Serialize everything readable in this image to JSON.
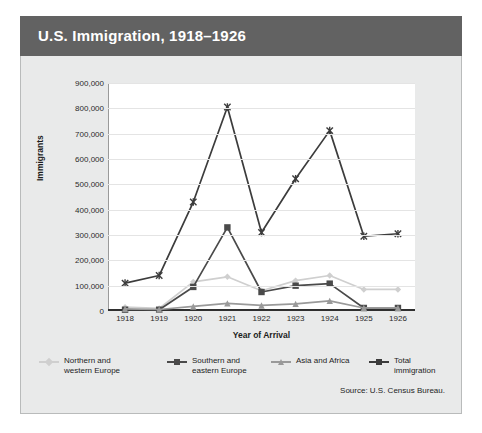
{
  "header": {
    "title": "U.S. Immigration, 1918–1926"
  },
  "source_note": "Source: U.S. Census Bureau.",
  "axis": {
    "ylabel": "Immigrants",
    "xlabel": "Year of Arrival"
  },
  "colors": {
    "title_bar": "#626262",
    "panel": "#e9eaea",
    "plot_bg": "#ffffff",
    "grid": "#e4e4e4",
    "northern_western": "#cfcfcf",
    "southern_eastern": "#4a4a4a",
    "asia_africa": "#9a9a9a",
    "total": "#3c3c3c"
  },
  "legend": {
    "items": [
      {
        "label": "Northern and\nwestern Europe",
        "color": "#cfcfcf",
        "marker": "diamond"
      },
      {
        "label": "Southern and\neastern Europe",
        "color": "#4a4a4a",
        "marker": "square"
      },
      {
        "label": "Asia and Africa",
        "color": "#9a9a9a",
        "marker": "triangle"
      },
      {
        "label": "Total immigration",
        "color": "#3c3c3c",
        "marker": "cross"
      }
    ]
  },
  "chart_data": {
    "type": "line",
    "title": "U.S. Immigration, 1918–1926",
    "xlabel": "Year of Arrival",
    "ylabel": "Immigrants",
    "categories": [
      "1918",
      "1919",
      "1920",
      "1921",
      "1922",
      "1923",
      "1924",
      "1925",
      "1926"
    ],
    "x": [
      1918,
      1919,
      1920,
      1921,
      1922,
      1923,
      1924,
      1925,
      1926
    ],
    "ylim": [
      0,
      900000
    ],
    "ytick_labels": [
      "900,000",
      "800,000",
      "700,000",
      "600,000",
      "500,000",
      "400,000",
      "300,000",
      "200,000",
      "100,000",
      "0"
    ],
    "ytick_values": [
      900000,
      800000,
      700000,
      600000,
      500000,
      400000,
      300000,
      200000,
      100000,
      0
    ],
    "grid": true,
    "legend_position": "bottom",
    "series": [
      {
        "name": "Northern and western Europe",
        "color": "#cfcfcf",
        "marker": "diamond",
        "values": [
          15000,
          10000,
          115000,
          135000,
          80000,
          120000,
          140000,
          85000,
          85000
        ]
      },
      {
        "name": "Southern and eastern Europe",
        "color": "#4a4a4a",
        "marker": "square",
        "values": [
          5000,
          5000,
          95000,
          330000,
          75000,
          100000,
          108000,
          12000,
          12000
        ]
      },
      {
        "name": "Asia and Africa",
        "color": "#9a9a9a",
        "marker": "triangle",
        "values": [
          8000,
          6000,
          18000,
          30000,
          22000,
          28000,
          40000,
          12000,
          12000
        ]
      },
      {
        "name": "Total immigration",
        "color": "#3c3c3c",
        "marker": "cross",
        "values": [
          110000,
          140000,
          430000,
          805000,
          310000,
          522000,
          712000,
          295000,
          305000
        ]
      }
    ]
  }
}
